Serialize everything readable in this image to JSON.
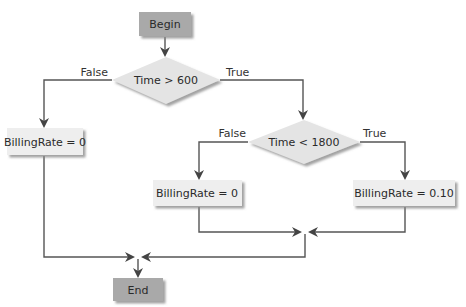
{
  "diagram": {
    "type": "flowchart",
    "colors": {
      "terminal_fill": "#a9a9a9",
      "process_fill": "#eeeeee",
      "decision_fill": "#e4e4e4",
      "shadow": "#9a9a9a",
      "line": "#555555",
      "text": "#2a2a2a"
    },
    "nodes": {
      "begin": {
        "label": "Begin",
        "shape": "terminal"
      },
      "decision1": {
        "label": "Time > 600",
        "shape": "decision"
      },
      "rate_zero_left": {
        "label": "BillingRate = 0",
        "shape": "process"
      },
      "decision2": {
        "label": "Time < 1800",
        "shape": "decision"
      },
      "rate_zero_mid": {
        "label": "BillingRate = 0",
        "shape": "process"
      },
      "rate_ten": {
        "label": "BillingRate = 0.10",
        "shape": "process"
      },
      "end": {
        "label": "End",
        "shape": "terminal"
      }
    },
    "edge_labels": {
      "d1_false": "False",
      "d1_true": "True",
      "d2_false": "False",
      "d2_true": "True"
    }
  }
}
